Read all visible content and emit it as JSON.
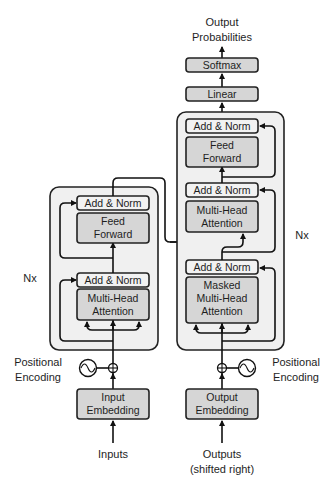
{
  "colors": {
    "stack_fill": "#f0f0f0",
    "sublayer_fill": "#d6d6d6",
    "add_norm_fill": "#f2f2f2",
    "stroke": "#222222"
  },
  "output_label": {
    "line1": "Output",
    "line2": "Probabilities"
  },
  "decoder_head": {
    "softmax": "Softmax",
    "linear": "Linear"
  },
  "encoder": {
    "repeat_label": "Nx",
    "add_norm_top": "Add & Norm",
    "feed_forward": {
      "line1": "Feed",
      "line2": "Forward"
    },
    "add_norm_bottom": "Add & Norm",
    "attention": {
      "line1": "Multi-Head",
      "line2": "Attention"
    },
    "positional_encoding": {
      "line1": "Positional",
      "line2": "Encoding"
    },
    "embedding": {
      "line1": "Input",
      "line2": "Embedding"
    },
    "input_label": "Inputs"
  },
  "decoder": {
    "repeat_label": "Nx",
    "add_norm_top": "Add & Norm",
    "feed_forward": {
      "line1": "Feed",
      "line2": "Forward"
    },
    "add_norm_middle": "Add & Norm",
    "attention": {
      "line1": "Multi-Head",
      "line2": "Attention"
    },
    "add_norm_bottom": "Add & Norm",
    "masked_attention": {
      "line1": "Masked",
      "line2": "Multi-Head",
      "line3": "Attention"
    },
    "positional_encoding": {
      "line1": "Positional",
      "line2": "Encoding"
    },
    "embedding": {
      "line1": "Output",
      "line2": "Embedding"
    },
    "input_label": {
      "line1": "Outputs",
      "line2": "(shifted right)"
    }
  }
}
